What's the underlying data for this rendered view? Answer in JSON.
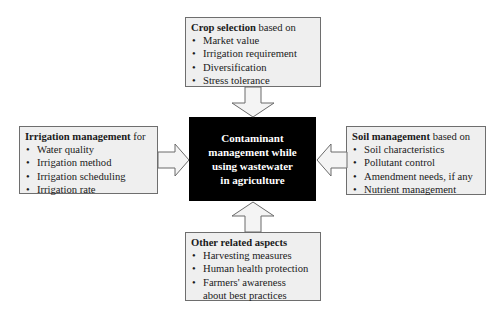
{
  "center": {
    "lines": [
      "Contaminant",
      "management while",
      "using wastewater",
      "in agriculture"
    ]
  },
  "top_box": {
    "title_bold": "Crop selection",
    "title_rest": " based on",
    "items": [
      "Market value",
      "Irrigation requirement",
      "Diversification",
      "Stress tolerance"
    ]
  },
  "left_box": {
    "title_bold": "Irrigation management",
    "title_rest": " for",
    "items": [
      "Water quality",
      "Irrigation method",
      "Irrigation scheduling",
      "Irrigation rate"
    ]
  },
  "right_box": {
    "title_bold": "Soil management",
    "title_rest": " based on",
    "items": [
      "Soil characteristics",
      "Pollutant control",
      "Amendment needs, if any",
      "Nutrient management"
    ]
  },
  "bottom_box": {
    "title_bold": "Other related aspects",
    "title_rest": "",
    "items": [
      "Harvesting measures",
      "Human health protection",
      "Farmers' awareness",
      "about best practices"
    ]
  },
  "colors": {
    "box_fill": "#efefef",
    "box_border": "#6e6e6e",
    "center_fill": "#000000",
    "center_text": "#ffffff"
  }
}
